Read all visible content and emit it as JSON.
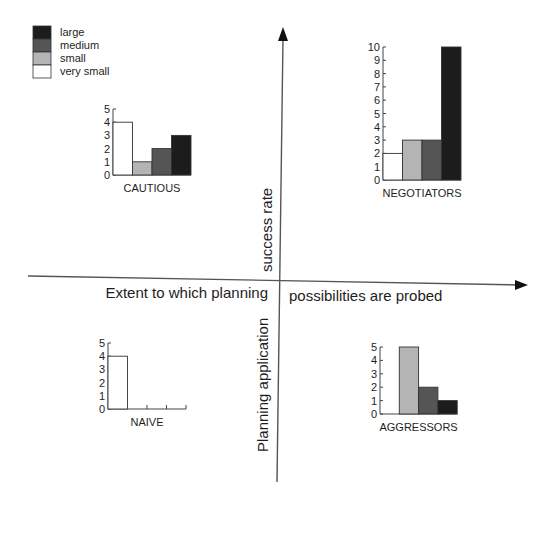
{
  "legend": {
    "items": [
      {
        "label": "large",
        "color": "#1c1c1c"
      },
      {
        "label": "medium",
        "color": "#555555"
      },
      {
        "label": "small",
        "color": "#b4b4b4"
      },
      {
        "label": "very small",
        "color": "#ffffff"
      }
    ]
  },
  "axes": {
    "x_left_label": "Extent to which planning",
    "x_right_label": "possibilities are probed",
    "y_top_label": "success rate",
    "y_bottom_label": "Planning application"
  },
  "chart_data": [
    {
      "type": "bar",
      "title": "CAUTIOUS",
      "quadrant": "top-left",
      "categories": [
        "very small",
        "small",
        "medium",
        "large"
      ],
      "values": [
        4,
        1,
        2,
        3
      ],
      "ylim": [
        0,
        5
      ],
      "yticks": [
        "0",
        "1",
        "2",
        "3",
        "4",
        "5"
      ]
    },
    {
      "type": "bar",
      "title": "NEGOTIATORS",
      "quadrant": "top-right",
      "categories": [
        "very small",
        "small",
        "medium",
        "large"
      ],
      "values": [
        2,
        3,
        3,
        10
      ],
      "ylim": [
        0,
        10
      ],
      "yticks": [
        "0",
        "1",
        "2",
        "3",
        "4",
        "5",
        "6",
        "7",
        "8",
        "9",
        "10"
      ]
    },
    {
      "type": "bar",
      "title": "NAIVE",
      "quadrant": "bottom-left",
      "categories": [
        "very small",
        "small",
        "medium",
        "large"
      ],
      "values": [
        4,
        0,
        0,
        0
      ],
      "ylim": [
        0,
        5
      ],
      "yticks": [
        "0",
        "1",
        "2",
        "3",
        "4",
        "5"
      ]
    },
    {
      "type": "bar",
      "title": "AGGRESSORS",
      "quadrant": "bottom-right",
      "categories": [
        "very small",
        "small",
        "medium",
        "large"
      ],
      "values": [
        0,
        5,
        2,
        1
      ],
      "ylim": [
        0,
        5
      ],
      "yticks": [
        "0",
        "1",
        "2",
        "3",
        "4",
        "5"
      ]
    }
  ]
}
